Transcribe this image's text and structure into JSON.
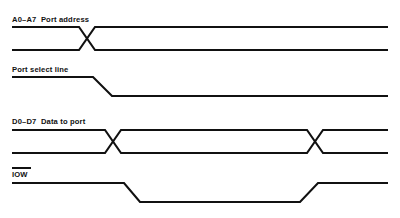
{
  "diagram": {
    "type": "timing-diagram",
    "width": 400,
    "height": 218,
    "background_color": "#ffffff",
    "line_color": "#111111",
    "line_width": 2.1,
    "signals": [
      {
        "id": "address-bus",
        "label": "A0–A7  Port address",
        "label_x": 12,
        "label_y": 22,
        "style": "bus",
        "overbar": false,
        "top_y": 27,
        "bottom_y": 50,
        "x_start": 12,
        "x_end": 388,
        "transitions": [
          {
            "type": "cross",
            "center_x": 87,
            "half_width": 8
          }
        ]
      },
      {
        "id": "port-select-line",
        "label": "Port select line",
        "label_x": 12,
        "label_y": 72,
        "style": "single",
        "overbar": false,
        "high_y": 77,
        "low_y": 96,
        "x_start": 12,
        "x_end": 388,
        "transitions": [
          {
            "type": "fall",
            "x_begin": 93,
            "x_end": 112
          }
        ]
      },
      {
        "id": "data-bus",
        "label": "D0–D7  Data to port",
        "label_x": 12,
        "label_y": 124,
        "style": "bus",
        "overbar": false,
        "top_y": 130,
        "bottom_y": 153,
        "x_start": 12,
        "x_end": 388,
        "transitions": [
          {
            "type": "cross",
            "center_x": 113,
            "half_width": 8
          },
          {
            "type": "cross",
            "center_x": 315,
            "half_width": 8
          }
        ]
      },
      {
        "id": "iow-strobe",
        "label": "IOW",
        "label_x": 12,
        "label_y": 177,
        "style": "single",
        "overbar": true,
        "overbar_x1": 12,
        "overbar_x2": 31,
        "overbar_y": 168,
        "high_y": 183,
        "low_y": 202,
        "x_start": 12,
        "x_end": 388,
        "transitions": [
          {
            "type": "fall",
            "x_begin": 124,
            "x_end": 140
          },
          {
            "type": "rise",
            "x_begin": 300,
            "x_end": 318
          }
        ]
      }
    ]
  }
}
